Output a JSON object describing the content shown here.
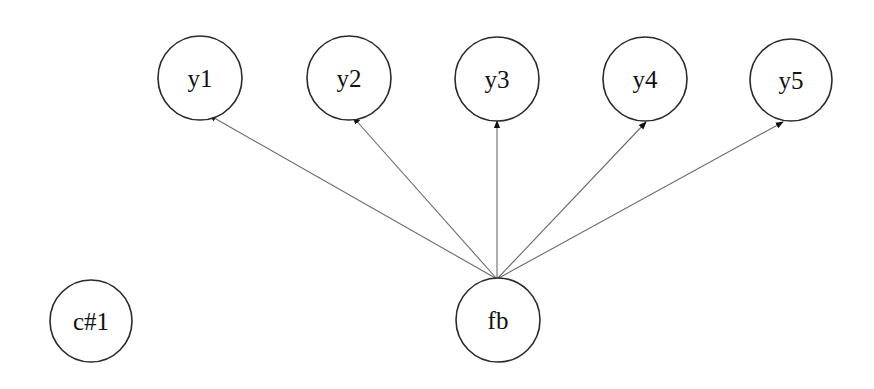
{
  "diagram": {
    "type": "path-diagram",
    "nodes": [
      {
        "id": "y1",
        "label": "y1",
        "cx": 200,
        "cy": 78,
        "r": 42
      },
      {
        "id": "y2",
        "label": "y2",
        "cx": 349,
        "cy": 78,
        "r": 42
      },
      {
        "id": "y3",
        "label": "y3",
        "cx": 497,
        "cy": 79,
        "r": 42
      },
      {
        "id": "y4",
        "label": "y4",
        "cx": 645,
        "cy": 79,
        "r": 42
      },
      {
        "id": "y5",
        "label": "y5",
        "cx": 791,
        "cy": 80,
        "r": 41
      },
      {
        "id": "c1",
        "label": "c#1",
        "cx": 91,
        "cy": 321,
        "r": 41
      },
      {
        "id": "fb",
        "label": "fb",
        "cx": 498,
        "cy": 320,
        "r": 42
      }
    ],
    "edges": [
      {
        "from": "fb",
        "to": "y1",
        "x1": 497,
        "y1": 279,
        "x2": 209,
        "y2": 115
      },
      {
        "from": "fb",
        "to": "y2",
        "x1": 497,
        "y1": 279,
        "x2": 353,
        "y2": 117
      },
      {
        "from": "fb",
        "to": "y3",
        "x1": 497,
        "y1": 279,
        "x2": 497,
        "y2": 121
      },
      {
        "from": "fb",
        "to": "y4",
        "x1": 497,
        "y1": 279,
        "x2": 646,
        "y2": 122
      },
      {
        "from": "fb",
        "to": "y5",
        "x1": 497,
        "y1": 279,
        "x2": 783,
        "y2": 122
      }
    ],
    "colors": {
      "node_stroke": "#2a2a2a",
      "edge_stroke": "#6a6a6a",
      "arrowhead": "#111111",
      "background": "#ffffff"
    }
  }
}
